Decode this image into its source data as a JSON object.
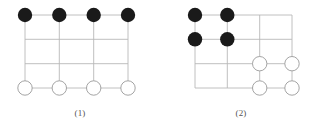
{
  "document": {
    "background_color": "#ffffff",
    "type": "geometry-diagram-pair"
  },
  "style": {
    "grid_line_color": "#b9b9b9",
    "grid_line_width": 0.9,
    "black_stone_color": "#1a1a1a",
    "white_stone_fill": "#ffffff",
    "white_stone_stroke": "#9a9a9a",
    "white_stone_stroke_width": 0.9,
    "stone_radius": 7.2,
    "caption_color": "#555555"
  },
  "figures": [
    {
      "id": "figure-1",
      "caption": "(1)",
      "grid": {
        "columns": 4,
        "rows": 4,
        "cell_width": 34.3,
        "cell_height": 24.3,
        "origin_x": 25,
        "origin_y": 15,
        "x_positions": [
          25,
          59.3,
          93.7,
          128
        ],
        "y_positions": [
          15,
          39.3,
          63.7,
          88
        ]
      },
      "black_stones": [
        {
          "col": 0,
          "row": 0
        },
        {
          "col": 1,
          "row": 0
        },
        {
          "col": 2,
          "row": 0
        },
        {
          "col": 3,
          "row": 0
        }
      ],
      "white_stones": [
        {
          "col": 0,
          "row": 3
        },
        {
          "col": 1,
          "row": 3
        },
        {
          "col": 2,
          "row": 3
        },
        {
          "col": 3,
          "row": 3
        }
      ]
    },
    {
      "id": "figure-2",
      "caption": "(2)",
      "grid": {
        "columns": 4,
        "rows": 4,
        "cell_width": 32.3,
        "cell_height": 24.3,
        "origin_x": 34,
        "origin_y": 15,
        "x_positions": [
          34,
          66.3,
          98.7,
          131
        ],
        "y_positions": [
          15,
          39.3,
          63.7,
          88
        ]
      },
      "black_stones": [
        {
          "col": 0,
          "row": 0
        },
        {
          "col": 1,
          "row": 0
        },
        {
          "col": 0,
          "row": 1
        },
        {
          "col": 1,
          "row": 1
        }
      ],
      "white_stones": [
        {
          "col": 2,
          "row": 2
        },
        {
          "col": 3,
          "row": 2
        },
        {
          "col": 2,
          "row": 3
        },
        {
          "col": 3,
          "row": 3
        }
      ]
    }
  ]
}
